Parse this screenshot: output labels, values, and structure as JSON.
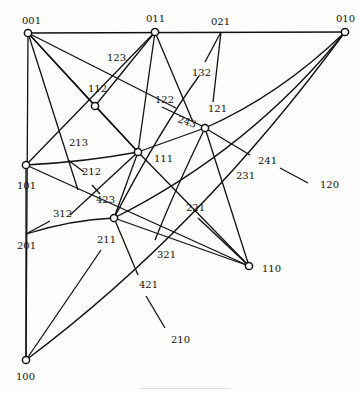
{
  "diagram": {
    "type": "graph",
    "vertices": [
      {
        "id": "001",
        "label": "001",
        "x": 28,
        "y": 33,
        "lx": 22,
        "ly": 24
      },
      {
        "id": "011",
        "label": "011",
        "x": 155,
        "y": 32,
        "lx": 146,
        "ly": 22
      },
      {
        "id": "010",
        "label": "010",
        "x": 345,
        "y": 32,
        "lx": 336,
        "ly": 22
      },
      {
        "id": "112",
        "label": "112",
        "x": 95,
        "y": 106,
        "lx": 88,
        "ly": 92
      },
      {
        "id": "121",
        "label": "121",
        "x": 205,
        "y": 128,
        "lx": 208,
        "ly": 112
      },
      {
        "id": "111",
        "label": "111",
        "x": 138,
        "y": 152,
        "lx": 154,
        "ly": 162
      },
      {
        "id": "101",
        "label": "101",
        "x": 26,
        "y": 165,
        "lx": 17,
        "ly": 189
      },
      {
        "id": "211",
        "label": "211",
        "x": 114,
        "y": 218,
        "lx": 97,
        "ly": 243
      },
      {
        "id": "110",
        "label": "110",
        "x": 249,
        "y": 266,
        "lx": 262,
        "ly": 272
      },
      {
        "id": "100",
        "label": "100",
        "x": 26,
        "y": 360,
        "lx": 16,
        "ly": 380
      }
    ],
    "edge_labels": [
      {
        "label": "021",
        "x": 211,
        "y": 25
      },
      {
        "label": "123",
        "x": 107,
        "y": 61
      },
      {
        "label": "132",
        "x": 192,
        "y": 76
      },
      {
        "label": "122",
        "x": 155,
        "y": 103
      },
      {
        "label": "243",
        "x": 177,
        "y": 122,
        "rotate": 18
      },
      {
        "label": "213",
        "x": 69,
        "y": 146
      },
      {
        "label": "212",
        "x": 82,
        "y": 175
      },
      {
        "label": "423",
        "x": 96,
        "y": 203
      },
      {
        "label": "312",
        "x": 53,
        "y": 217
      },
      {
        "label": "201",
        "x": 17,
        "y": 249
      },
      {
        "label": "241",
        "x": 258,
        "y": 164
      },
      {
        "label": "231",
        "x": 236,
        "y": 179
      },
      {
        "label": "120",
        "x": 320,
        "y": 188
      },
      {
        "label": "221",
        "x": 186,
        "y": 211
      },
      {
        "label": "321",
        "x": 157,
        "y": 258
      },
      {
        "label": "421",
        "x": 139,
        "y": 288
      },
      {
        "label": "210",
        "x": 171,
        "y": 343
      }
    ]
  }
}
